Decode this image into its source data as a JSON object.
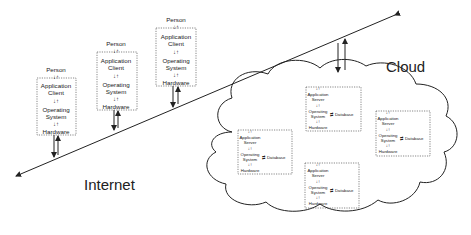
{
  "labels": {
    "internet": "Internet",
    "cloud": "Cloud"
  },
  "clients": [
    {
      "person": "Person",
      "app1": "Application",
      "app2": "Client",
      "os1": "Operating",
      "os2": "System",
      "hw": "Hardware"
    },
    {
      "person": "Person",
      "app1": "Application",
      "app2": "Client",
      "os1": "Operating",
      "os2": "System",
      "hw": "Hardware"
    },
    {
      "person": "Person",
      "app1": "Application",
      "app2": "Client",
      "os1": "Operating",
      "os2": "System",
      "hw": "Hardware"
    }
  ],
  "servers": [
    {
      "app1": "Application",
      "app2": "Server",
      "os1": "Operating",
      "os2": "System",
      "hw": "Hardware",
      "db": "Database"
    },
    {
      "app1": "Application",
      "app2": "Server",
      "os1": "Operating",
      "os2": "System",
      "hw": "Hardware",
      "db": "Database"
    },
    {
      "app1": "Application",
      "app2": "Server",
      "os1": "Operating",
      "os2": "System",
      "hw": "Hardware",
      "db": "Database"
    },
    {
      "app1": "Application",
      "app2": "Server",
      "os1": "Operating",
      "os2": "System",
      "hw": "Hardware",
      "db": "Database"
    }
  ],
  "glyphs": {
    "updown": "↓↑",
    "leftright": "⇄"
  }
}
